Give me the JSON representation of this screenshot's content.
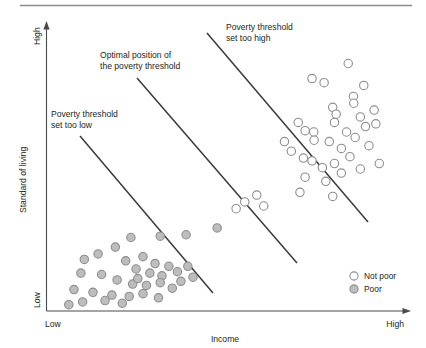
{
  "chart_data": {
    "type": "scatter",
    "title": "",
    "subtitle": "",
    "xlabel": "Income",
    "ylabel": "Standard of living",
    "xlim": [
      0,
      100
    ],
    "ylim": [
      0,
      100
    ],
    "grid": false,
    "x_tick_labels": [
      "Low",
      "High"
    ],
    "y_tick_labels": [
      "Low",
      "High"
    ],
    "legend_position": "bottom-right",
    "legend": [
      {
        "label": "Not poor",
        "marker": "open-circle",
        "fill": "#ffffff",
        "stroke": "#8d8d8d"
      },
      {
        "label": "Poor",
        "marker": "filled-circle",
        "fill": "#bdbdbd",
        "stroke": "#8d8d8d"
      }
    ],
    "series": [
      {
        "name": "Not poor",
        "marker": "open-circle",
        "fill": "#ffffff",
        "stroke": "#8d8d8d",
        "points": [
          [
            74.5,
            83.0
          ],
          [
            78.0,
            81.5
          ],
          [
            85.0,
            88.5
          ],
          [
            89.5,
            80.5
          ],
          [
            80.5,
            72.5
          ],
          [
            81.5,
            70.0
          ],
          [
            86.5,
            76.5
          ],
          [
            86.6,
            74.0
          ],
          [
            70.5,
            67.0
          ],
          [
            72.5,
            64.0
          ],
          [
            75.0,
            63.5
          ],
          [
            75.1,
            60.5
          ],
          [
            81.0,
            67.0
          ],
          [
            84.5,
            63.5
          ],
          [
            88.5,
            69.0
          ],
          [
            90.0,
            65.5
          ],
          [
            92.5,
            71.5
          ],
          [
            93.0,
            66.5
          ],
          [
            66.5,
            60.0
          ],
          [
            68.5,
            56.5
          ],
          [
            72.0,
            54.0
          ],
          [
            79.5,
            60.0
          ],
          [
            83.0,
            57.5
          ],
          [
            87.0,
            61.5
          ],
          [
            91.0,
            58.5
          ],
          [
            74.5,
            53.0
          ],
          [
            77.5,
            50.5
          ],
          [
            81.0,
            52.0
          ],
          [
            85.5,
            54.5
          ],
          [
            88.5,
            50.0
          ],
          [
            94.0,
            52.0
          ],
          [
            72.5,
            47.0
          ],
          [
            78.5,
            45.5
          ],
          [
            83.0,
            48.5
          ],
          [
            71.0,
            41.5
          ],
          [
            80.5,
            40.0
          ],
          [
            55.0,
            38.0
          ],
          [
            58.5,
            40.5
          ],
          [
            60.5,
            36.5
          ],
          [
            52.5,
            35.5
          ]
        ]
      },
      {
        "name": "Poor",
        "marker": "filled-circle",
        "fill": "#bdbdbd",
        "stroke": "#8d8d8d",
        "points": [
          [
            47.0,
            28.5
          ],
          [
            38.0,
            26.0
          ],
          [
            30.5,
            25.5
          ],
          [
            22.0,
            25.0
          ],
          [
            17.5,
            21.5
          ],
          [
            12.5,
            19.0
          ],
          [
            8.5,
            17.0
          ],
          [
            20.5,
            16.5
          ],
          [
            25.5,
            18.0
          ],
          [
            29.0,
            15.5
          ],
          [
            33.0,
            14.5
          ],
          [
            23.5,
            13.5
          ],
          [
            27.5,
            12.0
          ],
          [
            31.0,
            11.0
          ],
          [
            35.5,
            12.5
          ],
          [
            38.5,
            14.5
          ],
          [
            40.0,
            10.5
          ],
          [
            7.5,
            12.0
          ],
          [
            13.5,
            11.5
          ],
          [
            18.0,
            9.5
          ],
          [
            22.5,
            8.0
          ],
          [
            26.5,
            7.5
          ],
          [
            30.5,
            8.5
          ],
          [
            34.0,
            6.5
          ],
          [
            5.5,
            6.0
          ],
          [
            11.0,
            5.0
          ],
          [
            16.5,
            4.0
          ],
          [
            21.5,
            3.5
          ],
          [
            25.5,
            4.5
          ],
          [
            30.0,
            3.0
          ],
          [
            8.0,
            1.5
          ],
          [
            14.5,
            2.0
          ],
          [
            19.5,
            1.0
          ],
          [
            4.0,
            0.5
          ],
          [
            24.0,
            10.0
          ],
          [
            36.5,
            9.0
          ]
        ]
      }
    ],
    "threshold_lines": [
      {
        "id": "too-low",
        "label": "Poverty threshold\nset too low",
        "label_line_1": "Poverty threshold",
        "label_line_2": "set too low",
        "color": "#3a3a3a"
      },
      {
        "id": "optimal",
        "label": "Optimal position of\nthe poverty threshold",
        "label_line_1": "Optimal position of",
        "label_line_2": "the poverty threshold",
        "color": "#3a3a3a"
      },
      {
        "id": "too-high",
        "label": "Poverty threshold\nset too high",
        "label_line_1": "Poverty threshold",
        "label_line_2": "set too high",
        "color": "#3a3a3a"
      }
    ]
  },
  "annotations": {
    "too_low_line1": "Poverty threshold",
    "too_low_line2": "set too low",
    "optimal_line1": "Optimal position of",
    "optimal_line2": "the poverty threshold",
    "too_high_line1": "Poverty threshold",
    "too_high_line2": "set too high"
  },
  "axes": {
    "x_label": "Income",
    "x_low": "Low",
    "x_high": "High",
    "y_label": "Standard of living",
    "y_low": "Low",
    "y_high": "High"
  },
  "legend": {
    "not_poor": "Not poor",
    "poor": "Poor"
  },
  "colors": {
    "axis": "#4a4a4a",
    "line": "#3a3a3a",
    "poor_fill": "#bdbdbd",
    "marker_stroke": "#8d8d8d",
    "rule": "#808080",
    "text": "#231f20"
  }
}
